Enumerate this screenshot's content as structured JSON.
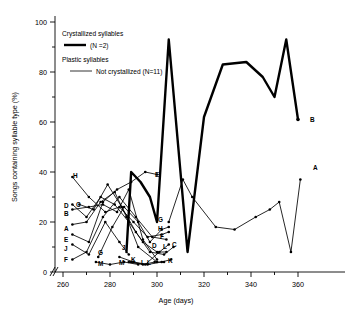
{
  "figure": {
    "background": "#ffffff",
    "ink": "#000000"
  },
  "axes": {
    "x": {
      "label": "Age (days)",
      "ticks": [
        260,
        280,
        300,
        320,
        340,
        360
      ],
      "minor_step": 10,
      "range": [
        258,
        366
      ],
      "break_mark": "//"
    },
    "y": {
      "label": "Songs containing syllable type (%)",
      "ticks": [
        0,
        20,
        40,
        60,
        80,
        100
      ],
      "minor_step": 10,
      "range": [
        0,
        100
      ]
    }
  },
  "legend": {
    "entries": [
      {
        "title": "Crystallized syllables",
        "detail": "(N =2)",
        "style": "thick"
      },
      {
        "title": "Plastic syllables",
        "detail": "Not crystallized (N=11)",
        "style": "thin"
      }
    ]
  },
  "chart_data": {
    "type": "line",
    "title": "",
    "xlabel": "Age (days)",
    "ylabel": "Songs containing syllable type (%)",
    "xlim": [
      258,
      366
    ],
    "ylim": [
      0,
      100
    ],
    "grid": false,
    "legend_position": "top-left",
    "series": [
      {
        "name": "Crystallized syllables (N=2) - B",
        "style": "thick",
        "end_label": "B",
        "x": [
          287,
          289,
          293,
          297,
          300,
          305,
          313,
          320,
          328,
          338,
          345,
          350,
          355,
          360
        ],
        "y": [
          8,
          40,
          36,
          30,
          20,
          93,
          8,
          62,
          83,
          84,
          78,
          70,
          93,
          61
        ]
      },
      {
        "name": "Plastic syllables not crystallized (N=11) - A",
        "style": "thin",
        "end_label": "A",
        "x": [
          305,
          311,
          315,
          325,
          333,
          342,
          348,
          352,
          357,
          361
        ],
        "y": [
          20,
          37,
          30,
          18,
          17,
          22,
          25,
          28,
          8,
          37
        ]
      },
      {
        "name": "A",
        "style": "thin",
        "start_label": "A",
        "x": [
          264,
          270,
          276,
          282,
          287,
          292,
          300
        ],
        "y": [
          19,
          20,
          28,
          32,
          22,
          10,
          4
        ]
      },
      {
        "name": "B",
        "style": "thin",
        "start_label": "B",
        "x": [
          264,
          271,
          277,
          283,
          288,
          294,
          300
        ],
        "y": [
          25,
          26,
          27,
          24,
          33,
          13,
          5
        ]
      },
      {
        "name": "C",
        "style": "thin",
        "start_label": "C",
        "end_label": "C",
        "x": [
          267,
          273,
          279,
          285,
          291,
          297,
          303,
          307
        ],
        "y": [
          27,
          25,
          35,
          26,
          16,
          8,
          7,
          10
        ]
      },
      {
        "name": "D",
        "style": "thin",
        "start_label": "D",
        "end_label": "D",
        "x": [
          264,
          270,
          276,
          282,
          288,
          294,
          300,
          304
        ],
        "y": [
          27,
          22,
          30,
          27,
          20,
          12,
          8,
          8
        ]
      },
      {
        "name": "E",
        "style": "thin",
        "start_label": "E",
        "end_label": "E",
        "x": [
          264,
          271,
          277,
          283,
          289,
          295,
          300
        ],
        "y": [
          15,
          12,
          28,
          33,
          36,
          40,
          39
        ]
      },
      {
        "name": "F",
        "style": "thin",
        "start_label": "F",
        "end_label": "F",
        "x": [
          264,
          270,
          277,
          284,
          291,
          298,
          304
        ],
        "y": [
          5,
          8,
          22,
          30,
          22,
          14,
          13
        ]
      },
      {
        "name": "G",
        "style": "thin",
        "start_label": "G",
        "end_label": "G",
        "x": [
          275,
          281,
          286,
          292,
          297,
          302,
          305
        ],
        "y": [
          6,
          18,
          26,
          20,
          12,
          17,
          18
        ]
      },
      {
        "name": "H",
        "style": "thin",
        "start_label": "H",
        "end_label": "H",
        "x": [
          264,
          271,
          278,
          284,
          290,
          296,
          302,
          305
        ],
        "y": [
          38,
          30,
          24,
          26,
          20,
          14,
          15,
          16
        ]
      },
      {
        "name": "I",
        "style": "thin",
        "start_label": "I",
        "x": [
          288,
          294,
          299,
          303
        ],
        "y": [
          4,
          3,
          4,
          4
        ]
      },
      {
        "name": "J",
        "style": "thin",
        "start_label": "J",
        "x": [
          264,
          271,
          278,
          284,
          288
        ],
        "y": [
          11,
          7,
          20,
          12,
          7
        ]
      },
      {
        "name": "K",
        "style": "thin",
        "start_label": "K",
        "end_label": "K",
        "x": [
          284,
          290,
          296,
          302,
          306
        ],
        "y": [
          6,
          4,
          3,
          4,
          5
        ]
      },
      {
        "name": "L",
        "style": "thin",
        "start_label": "L",
        "end_label": "L",
        "x": [
          289,
          295,
          301,
          305
        ],
        "y": [
          4,
          3,
          8,
          11
        ]
      },
      {
        "name": "M",
        "style": "thin",
        "start_label": "M",
        "x": [
          274,
          280,
          286,
          292
        ],
        "y": [
          4,
          3,
          4,
          3
        ]
      }
    ],
    "point_labels": [
      {
        "text": "H",
        "x": 73,
        "y": 178
      },
      {
        "text": "D",
        "x": 64,
        "y": 208
      },
      {
        "text": "C",
        "x": 76,
        "y": 207
      },
      {
        "text": "B",
        "x": 64,
        "y": 216
      },
      {
        "text": "A",
        "x": 64,
        "y": 231
      },
      {
        "text": "E",
        "x": 64,
        "y": 242
      },
      {
        "text": "J",
        "x": 64,
        "y": 251
      },
      {
        "text": "F",
        "x": 64,
        "y": 262
      },
      {
        "text": "G",
        "x": 98,
        "y": 255
      },
      {
        "text": "M",
        "x": 98,
        "y": 266
      },
      {
        "text": "E",
        "x": 155,
        "y": 177
      },
      {
        "text": "J",
        "x": 122,
        "y": 250
      },
      {
        "text": "M",
        "x": 119,
        "y": 265
      },
      {
        "text": "K",
        "x": 131,
        "y": 262
      },
      {
        "text": "I",
        "x": 141,
        "y": 265
      },
      {
        "text": "L",
        "x": 147,
        "y": 265
      },
      {
        "text": "G",
        "x": 158,
        "y": 222
      },
      {
        "text": "H",
        "x": 158,
        "y": 231
      },
      {
        "text": "F",
        "x": 160,
        "y": 239
      },
      {
        "text": "D",
        "x": 152,
        "y": 248
      },
      {
        "text": "L",
        "x": 163,
        "y": 249
      },
      {
        "text": "C",
        "x": 172,
        "y": 247
      },
      {
        "text": "K",
        "x": 168,
        "y": 263
      },
      {
        "text": "B",
        "x": 310,
        "y": 122
      },
      {
        "text": "A",
        "x": 313,
        "y": 170
      }
    ]
  }
}
